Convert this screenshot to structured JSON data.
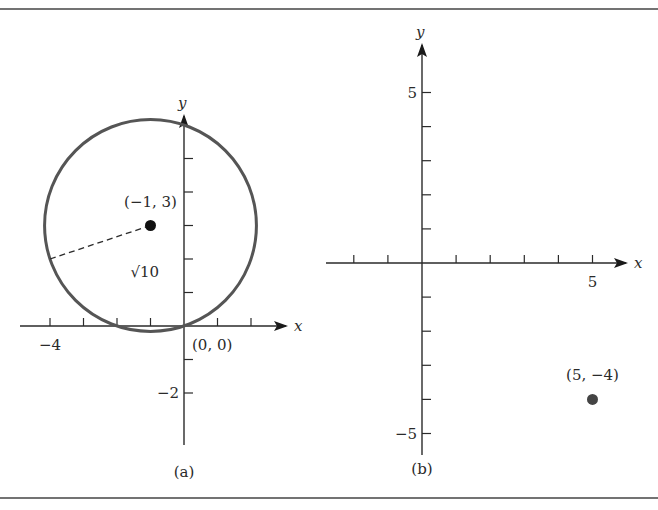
{
  "chart_data": [
    {
      "type": "scatter",
      "panel_label": "(a)",
      "title": "",
      "xlabel": "x",
      "ylabel": "y",
      "xlim": [
        -5,
        3
      ],
      "ylim": [
        -3.5,
        6.2
      ],
      "grid": false,
      "x_ticks": [
        -4,
        -3,
        -2,
        -1,
        1,
        2
      ],
      "y_ticks": [
        -2,
        -1,
        1,
        2,
        3,
        4,
        5
      ],
      "x_tick_labels": [
        {
          "value": -4,
          "text": "−4"
        }
      ],
      "y_tick_labels": [
        {
          "value": -2,
          "text": "−2"
        }
      ],
      "circle": {
        "center": [
          -1,
          3
        ],
        "radius": 3.1623,
        "color": "#555555"
      },
      "radius_segment": {
        "from": [
          -1,
          3
        ],
        "to": [
          -4,
          2
        ],
        "style": "dashed",
        "label": "√10"
      },
      "points": [
        {
          "x": -1,
          "y": 3,
          "label": "(−1, 3)",
          "color": "#111111",
          "marker": "filled"
        },
        {
          "x": 0,
          "y": 0,
          "label": "(0, 0)",
          "marker": "none"
        }
      ]
    },
    {
      "type": "scatter",
      "panel_label": "(b)",
      "title": "",
      "xlabel": "x",
      "ylabel": "y",
      "xlim": [
        -2.9,
        6
      ],
      "ylim": [
        -5.5,
        6.5
      ],
      "grid": false,
      "x_ticks": [
        -2,
        -1,
        1,
        2,
        3,
        4,
        5
      ],
      "y_ticks": [
        -5,
        -4,
        -3,
        -2,
        -1,
        1,
        2,
        3,
        4,
        5
      ],
      "x_tick_labels": [
        {
          "value": 5,
          "text": "5"
        }
      ],
      "y_tick_labels": [
        {
          "value": 5,
          "text": "5"
        },
        {
          "value": -5,
          "text": "−5"
        }
      ],
      "points": [
        {
          "x": 5,
          "y": -4,
          "label": "(5, −4)",
          "color": "#444444",
          "marker": "filled"
        }
      ]
    }
  ]
}
